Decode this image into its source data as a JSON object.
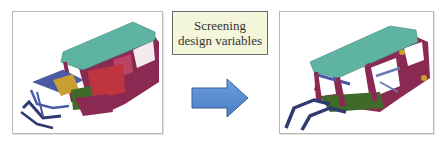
{
  "diagram": {
    "label": {
      "line1": "Screening",
      "line2": "design variables"
    },
    "arrow": {
      "direction": "right",
      "fill": "#5b8fd4",
      "stroke": "#3c5f93"
    },
    "panels": [
      {
        "name": "full-body-in-white",
        "description": "Car body-in-white model with all components"
      },
      {
        "name": "screened-body-in-white",
        "description": "Car body-in-white model with screened components"
      }
    ],
    "colors": {
      "roof": "#5fb3a3",
      "body": "#8a2a52",
      "structure": "#4a5aa6",
      "accent": "#c8a030",
      "floor": "#3e6a2a"
    }
  }
}
